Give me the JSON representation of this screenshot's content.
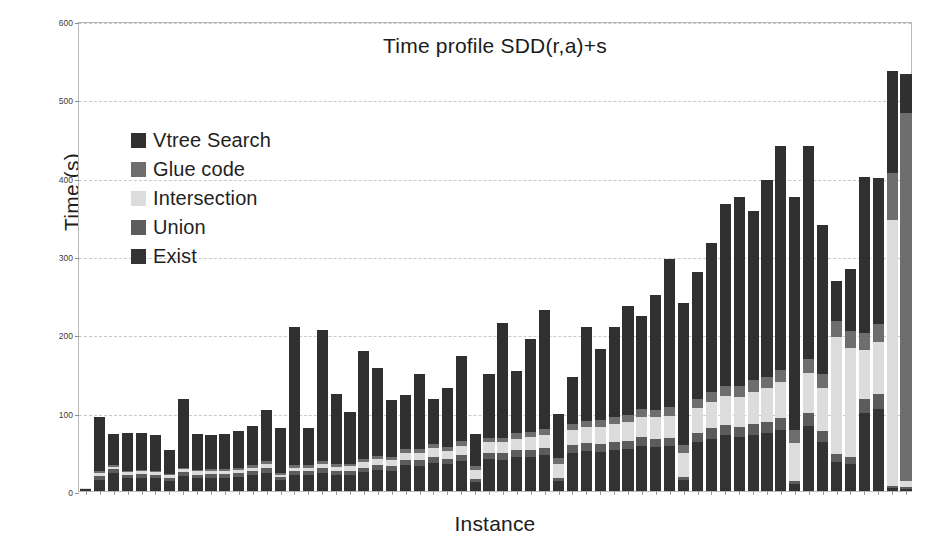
{
  "chart_data": {
    "type": "bar",
    "subtype": "stacked-bar",
    "title": "Time profile SDD(r,a)+s",
    "xlabel": "Instance",
    "ylabel": "Time (s)",
    "ylim": [
      0,
      600
    ],
    "yticks": [
      0,
      100,
      200,
      300,
      400,
      500,
      600
    ],
    "ytick_labels": [
      "0",
      "100",
      "200",
      "300",
      "400",
      "500",
      "600"
    ],
    "xticks_visible": true,
    "xtick_labels": [],
    "grid": "horizontal-dashed",
    "legend_position": "upper-left-inside",
    "legend_entries": [
      "Vtree Search",
      "Glue code",
      "Intersection",
      "Union",
      "Exist"
    ],
    "series": [
      {
        "name": "Exist",
        "color": "#333333",
        "values": [
          2.5,
          14,
          23,
          16,
          17,
          16,
          13,
          19,
          16,
          17,
          17,
          18,
          20,
          23,
          14,
          20,
          20,
          23,
          20,
          21,
          24,
          27,
          26,
          33,
          32,
          36,
          34,
          38,
          11,
          41,
          40,
          43,
          44,
          46,
          13,
          49,
          51,
          50,
          52,
          53,
          58,
          56,
          57,
          14,
          62,
          67,
          71,
          69,
          72,
          74,
          78,
          9,
          83,
          62,
          37,
          34,
          100,
          105,
          4,
          3
        ]
      },
      {
        "name": "Union",
        "color": "#5c5c5c",
        "values": [
          0.5,
          5,
          5,
          5,
          5,
          5,
          4,
          5,
          5,
          5,
          5,
          5,
          5,
          6,
          4,
          5,
          5,
          6,
          5,
          5,
          6,
          6,
          6,
          7,
          7,
          8,
          7,
          8,
          4,
          8,
          8,
          9,
          9,
          9,
          4,
          10,
          10,
          10,
          10,
          11,
          11,
          11,
          11,
          4,
          12,
          13,
          13,
          13,
          14,
          14,
          15,
          4,
          16,
          14,
          10,
          9,
          18,
          19,
          2,
          2
        ]
      },
      {
        "name": "Intersection",
        "color": "#dcdcdc",
        "values": [
          0.5,
          4,
          3,
          3,
          3,
          3,
          3,
          4,
          4,
          4,
          4,
          4,
          5,
          6,
          3,
          5,
          5,
          6,
          6,
          6,
          7,
          8,
          8,
          9,
          10,
          11,
          10,
          12,
          12,
          13,
          14,
          15,
          16,
          17,
          18,
          19,
          21,
          22,
          23,
          24,
          26,
          27,
          28,
          30,
          32,
          34,
          37,
          38,
          41,
          43,
          46,
          48,
          52,
          55,
          150,
          140,
          62,
          66,
          340,
          8
        ]
      },
      {
        "name": "Glue code",
        "color": "#6e6e6e",
        "values": [
          0.3,
          3,
          2,
          2,
          2,
          2,
          2,
          2,
          2,
          2,
          2,
          2,
          3,
          3,
          2,
          3,
          3,
          3,
          3,
          3,
          4,
          4,
          4,
          5,
          5,
          5,
          5,
          6,
          5,
          6,
          6,
          7,
          7,
          7,
          7,
          8,
          8,
          9,
          9,
          9,
          10,
          10,
          11,
          11,
          12,
          12,
          13,
          14,
          15,
          15,
          16,
          17,
          18,
          19,
          20,
          21,
          22,
          23,
          60,
          470
        ]
      },
      {
        "name": "Vtree Search",
        "color": "#303030",
        "values": [
          0.2,
          68,
          40,
          48,
          47,
          46,
          31,
          87,
          46,
          43,
          45,
          48,
          50,
          65,
          58,
          177,
          48,
          167,
          90,
          66,
          138,
          112,
          72,
          69,
          96,
          57,
          75,
          109,
          41,
          82,
          147,
          79,
          118,
          152,
          56,
          60,
          120,
          90,
          116,
          139,
          119,
          146,
          189,
          181,
          161,
          191,
          232,
          242,
          216,
          251,
          286,
          297,
          271,
          190,
          51,
          79,
          199,
          187,
          130,
          50
        ]
      }
    ]
  },
  "axes": {
    "ylabel": "Time (s)",
    "xlabel": "Instance"
  },
  "title": {
    "text": "Time profile SDD(r,a)+s"
  },
  "legend": {
    "items": [
      {
        "label": "Vtree Search",
        "color": "#303030"
      },
      {
        "label": "Glue code",
        "color": "#6e6e6e"
      },
      {
        "label": "Intersection",
        "color": "#dcdcdc"
      },
      {
        "label": "Union",
        "color": "#5c5c5c"
      },
      {
        "label": "Exist",
        "color": "#333333"
      }
    ]
  },
  "colors": {
    "grid": "#c8c8c8",
    "frame": "#b9b9b9",
    "text": "#1b1b1b",
    "background": "#ffffff"
  }
}
